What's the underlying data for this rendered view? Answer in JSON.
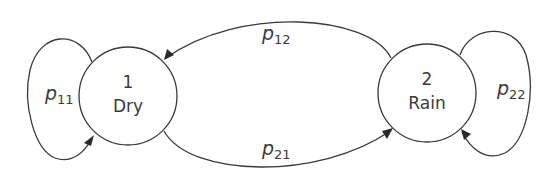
{
  "diagram": {
    "type": "state-transition",
    "nodes": [
      {
        "id": "1",
        "number": "1",
        "name": "Dry"
      },
      {
        "id": "2",
        "number": "2",
        "name": "Rain"
      }
    ],
    "edges": [
      {
        "from": "1",
        "to": "1",
        "label_main": "p",
        "label_sub": "11"
      },
      {
        "from": "2",
        "to": "1",
        "label_main": "p",
        "label_sub": "12"
      },
      {
        "from": "1",
        "to": "2",
        "label_main": "p",
        "label_sub": "21"
      },
      {
        "from": "2",
        "to": "2",
        "label_main": "p",
        "label_sub": "22"
      }
    ],
    "colors": {
      "stroke": "#3a3a3a",
      "background": "#ffffff"
    }
  }
}
